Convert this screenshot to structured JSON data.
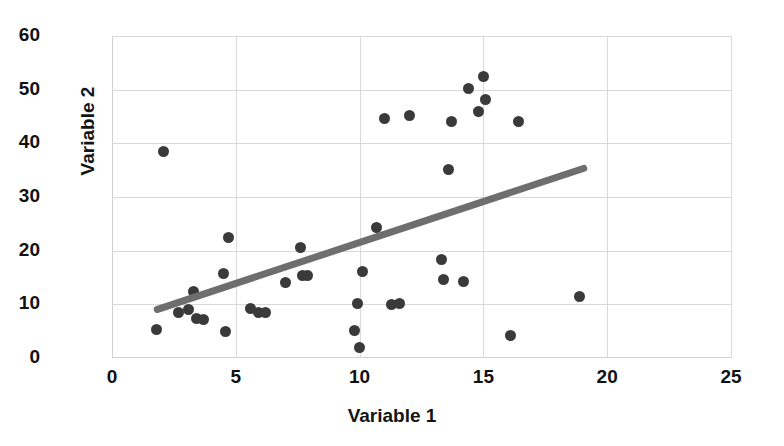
{
  "chart_data": {
    "type": "scatter",
    "title": "",
    "xlabel": "Variable 1",
    "ylabel": "Variable 2",
    "xlim": [
      0,
      25
    ],
    "ylim": [
      0,
      60
    ],
    "xticks": [
      0,
      5,
      10,
      15,
      20,
      25
    ],
    "yticks": [
      0,
      10,
      20,
      30,
      40,
      50,
      60
    ],
    "grid": true,
    "legend": "none",
    "point_color": "#3a3a3a",
    "trendline_color": "#6e6e6e",
    "grid_color": "#d9d9d9",
    "series": [
      {
        "name": "Observations",
        "points": [
          {
            "x": 1.8,
            "y": 5.4
          },
          {
            "x": 2.1,
            "y": 38.4
          },
          {
            "x": 2.7,
            "y": 8.4
          },
          {
            "x": 3.1,
            "y": 9.0
          },
          {
            "x": 3.3,
            "y": 12.3
          },
          {
            "x": 3.4,
            "y": 7.4
          },
          {
            "x": 3.7,
            "y": 7.2
          },
          {
            "x": 4.5,
            "y": 15.7
          },
          {
            "x": 4.6,
            "y": 5.0
          },
          {
            "x": 4.7,
            "y": 22.5
          },
          {
            "x": 5.6,
            "y": 9.3
          },
          {
            "x": 5.9,
            "y": 8.5
          },
          {
            "x": 6.2,
            "y": 8.4
          },
          {
            "x": 7.0,
            "y": 14.1
          },
          {
            "x": 7.6,
            "y": 20.6
          },
          {
            "x": 7.7,
            "y": 15.4
          },
          {
            "x": 7.9,
            "y": 15.3
          },
          {
            "x": 9.8,
            "y": 5.2
          },
          {
            "x": 9.9,
            "y": 10.2
          },
          {
            "x": 10.0,
            "y": 2.0
          },
          {
            "x": 10.1,
            "y": 16.1
          },
          {
            "x": 10.7,
            "y": 24.3
          },
          {
            "x": 11.0,
            "y": 44.6
          },
          {
            "x": 11.3,
            "y": 10.0
          },
          {
            "x": 11.6,
            "y": 10.2
          },
          {
            "x": 12.0,
            "y": 45.2
          },
          {
            "x": 13.3,
            "y": 18.3
          },
          {
            "x": 13.4,
            "y": 14.7
          },
          {
            "x": 13.6,
            "y": 35.2
          },
          {
            "x": 13.7,
            "y": 44.1
          },
          {
            "x": 14.2,
            "y": 14.3
          },
          {
            "x": 14.4,
            "y": 50.2
          },
          {
            "x": 14.8,
            "y": 45.9
          },
          {
            "x": 15.0,
            "y": 52.4
          },
          {
            "x": 15.1,
            "y": 48.2
          },
          {
            "x": 16.1,
            "y": 4.2
          },
          {
            "x": 16.4,
            "y": 44.1
          },
          {
            "x": 18.9,
            "y": 11.5
          }
        ]
      }
    ],
    "trendline": {
      "x0": 1.7,
      "y0": 8.9,
      "x1": 19.2,
      "y1": 35.6
    }
  }
}
